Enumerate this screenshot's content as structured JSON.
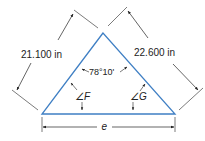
{
  "diagram": {
    "type": "triangle-dimension-drawing",
    "colors": {
      "triangle": "#3f7fc4",
      "dimension": "#222222"
    },
    "sides": {
      "left": {
        "label": "21.100 in"
      },
      "right": {
        "label": "22.600 in"
      },
      "bottom": {
        "label": "e"
      }
    },
    "angles": {
      "apex": {
        "label": "78°10'"
      },
      "left": {
        "label": "∠F"
      },
      "right": {
        "label": "∠G"
      }
    }
  }
}
